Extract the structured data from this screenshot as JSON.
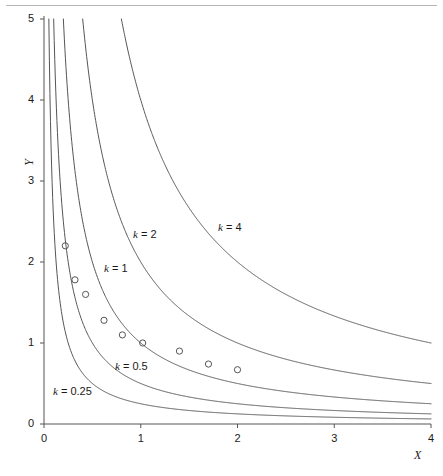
{
  "figure": {
    "background": "#ffffff",
    "line_color": "#555555",
    "text_color": "#1a1a1a",
    "top_rule_color": "#b6b6b6"
  },
  "axes": {
    "x": {
      "title": "X",
      "min": 0,
      "max": 4,
      "ticks": [
        0,
        1,
        2,
        3,
        4
      ],
      "tick_labels": [
        "0",
        "1",
        "2",
        "3",
        "4"
      ]
    },
    "y": {
      "title": "Y",
      "min": 0,
      "max": 5,
      "ticks": [
        0,
        1,
        2,
        3,
        4,
        5
      ],
      "tick_labels": [
        "0",
        "1",
        "2",
        "3",
        "4",
        "5"
      ]
    }
  },
  "curve_labels": [
    {
      "name": "k-4-label",
      "k_symbol": "k",
      "equals": " = ",
      "value": "4",
      "x": 218,
      "y": 221
    },
    {
      "name": "k-2-label",
      "k_symbol": "k",
      "equals": " = ",
      "value": "2",
      "x": 133,
      "y": 228
    },
    {
      "name": "k-1-label",
      "k_symbol": "k",
      "equals": " = ",
      "value": "1",
      "x": 104,
      "y": 262
    },
    {
      "name": "k-05-label",
      "k_symbol": "k",
      "equals": " = ",
      "value": "0.5",
      "x": 115,
      "y": 360
    },
    {
      "name": "k-025-label",
      "k_symbol": "k",
      "equals": " = ",
      "value": "0.25",
      "x": 53,
      "y": 385
    }
  ],
  "chart_data": {
    "type": "line",
    "title": "",
    "subtitle": "",
    "xlabel": "X",
    "ylabel": "Y",
    "xlim": [
      0,
      4
    ],
    "ylim": [
      0,
      5
    ],
    "grid": false,
    "legend": "inline curve labels",
    "equation": "Y = k / X",
    "series": [
      {
        "name": "k = 4",
        "k": 4,
        "label": "k = 4",
        "points": [
          {
            "x": 0.8,
            "y": 5.0
          },
          {
            "x": 0.9,
            "y": 4.444
          },
          {
            "x": 1.0,
            "y": 4.0
          },
          {
            "x": 1.2,
            "y": 3.333
          },
          {
            "x": 1.4,
            "y": 2.857
          },
          {
            "x": 1.6,
            "y": 2.5
          },
          {
            "x": 1.8,
            "y": 2.222
          },
          {
            "x": 2.0,
            "y": 2.0
          },
          {
            "x": 2.4,
            "y": 1.667
          },
          {
            "x": 2.8,
            "y": 1.429
          },
          {
            "x": 3.2,
            "y": 1.25
          },
          {
            "x": 3.6,
            "y": 1.111
          },
          {
            "x": 4.0,
            "y": 1.0
          }
        ]
      },
      {
        "name": "k = 2",
        "k": 2,
        "label": "k = 2",
        "points": [
          {
            "x": 0.4,
            "y": 5.0
          },
          {
            "x": 0.5,
            "y": 4.0
          },
          {
            "x": 0.6,
            "y": 3.333
          },
          {
            "x": 0.8,
            "y": 2.5
          },
          {
            "x": 1.0,
            "y": 2.0
          },
          {
            "x": 1.2,
            "y": 1.667
          },
          {
            "x": 1.5,
            "y": 1.333
          },
          {
            "x": 2.0,
            "y": 1.0
          },
          {
            "x": 2.5,
            "y": 0.8
          },
          {
            "x": 3.0,
            "y": 0.667
          },
          {
            "x": 3.5,
            "y": 0.571
          },
          {
            "x": 4.0,
            "y": 0.5
          }
        ]
      },
      {
        "name": "k = 1",
        "k": 1,
        "label": "k = 1",
        "points": [
          {
            "x": 0.2,
            "y": 5.0
          },
          {
            "x": 0.25,
            "y": 4.0
          },
          {
            "x": 0.3,
            "y": 3.333
          },
          {
            "x": 0.4,
            "y": 2.5
          },
          {
            "x": 0.5,
            "y": 2.0
          },
          {
            "x": 0.7,
            "y": 1.429
          },
          {
            "x": 1.0,
            "y": 1.0
          },
          {
            "x": 1.5,
            "y": 0.667
          },
          {
            "x": 2.0,
            "y": 0.5
          },
          {
            "x": 3.0,
            "y": 0.333
          },
          {
            "x": 4.0,
            "y": 0.25
          }
        ]
      },
      {
        "name": "k = 0.5",
        "k": 0.5,
        "label": "k = 0.5",
        "points": [
          {
            "x": 0.1,
            "y": 5.0
          },
          {
            "x": 0.125,
            "y": 4.0
          },
          {
            "x": 0.2,
            "y": 2.5
          },
          {
            "x": 0.25,
            "y": 2.0
          },
          {
            "x": 0.4,
            "y": 1.25
          },
          {
            "x": 0.5,
            "y": 1.0
          },
          {
            "x": 1.0,
            "y": 0.5
          },
          {
            "x": 2.0,
            "y": 0.25
          },
          {
            "x": 3.0,
            "y": 0.167
          },
          {
            "x": 4.0,
            "y": 0.125
          }
        ]
      },
      {
        "name": "k = 0.25",
        "k": 0.25,
        "label": "k = 0.25",
        "points": [
          {
            "x": 0.05,
            "y": 5.0
          },
          {
            "x": 0.0625,
            "y": 4.0
          },
          {
            "x": 0.1,
            "y": 2.5
          },
          {
            "x": 0.125,
            "y": 2.0
          },
          {
            "x": 0.25,
            "y": 1.0
          },
          {
            "x": 0.5,
            "y": 0.5
          },
          {
            "x": 1.0,
            "y": 0.25
          },
          {
            "x": 2.0,
            "y": 0.125
          },
          {
            "x": 3.0,
            "y": 0.083
          },
          {
            "x": 4.0,
            "y": 0.0625
          }
        ]
      }
    ],
    "scatter": {
      "name": "observed-points",
      "marker": "open-circle",
      "points": [
        {
          "x": 0.22,
          "y": 2.2
        },
        {
          "x": 0.32,
          "y": 1.78
        },
        {
          "x": 0.43,
          "y": 1.6
        },
        {
          "x": 0.62,
          "y": 1.28
        },
        {
          "x": 0.81,
          "y": 1.1
        },
        {
          "x": 1.02,
          "y": 1.0
        },
        {
          "x": 1.4,
          "y": 0.9
        },
        {
          "x": 1.7,
          "y": 0.74
        },
        {
          "x": 2.0,
          "y": 0.67
        }
      ]
    }
  }
}
